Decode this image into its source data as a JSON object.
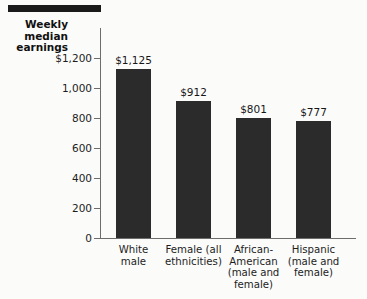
{
  "chart_data": {
    "type": "bar",
    "title": "",
    "xlabel": "",
    "ylabel": "Weekly median earnings",
    "ylabel_lines": [
      "Weekly",
      "median",
      "earnings"
    ],
    "categories": [
      "White male",
      "Female (all ethnicities)",
      "African-American (male and female)",
      "Hispanic (male and female)"
    ],
    "category_lines": [
      [
        "White",
        "male"
      ],
      [
        "Female (all",
        "ethnicities)"
      ],
      [
        "African-",
        "American",
        "(male and",
        "female)"
      ],
      [
        "Hispanic",
        "(male and",
        "female)"
      ]
    ],
    "values": [
      1125,
      912,
      801,
      777
    ],
    "value_labels": [
      "$1,125",
      "$912",
      "$801",
      "$777"
    ],
    "ylim": [
      0,
      1400
    ],
    "yticks": [
      0,
      200,
      400,
      600,
      800,
      1000,
      1200
    ],
    "ytick_labels": [
      "0",
      "200",
      "400",
      "600",
      "800",
      "1,000",
      "$1,200"
    ],
    "grid": false,
    "legend": null,
    "bar_color": "#2b2b2b",
    "axis_color": "#6d6d6d",
    "background": "#fbfbfa"
  }
}
